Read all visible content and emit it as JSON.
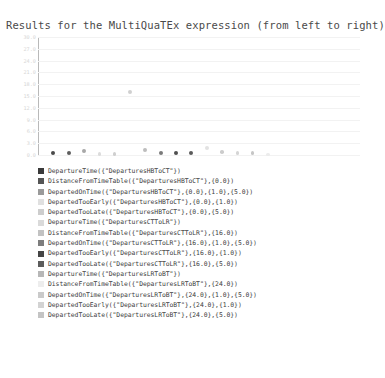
{
  "title": "Results for the MultiQuaTEx expression (from left to right)",
  "colors": {
    "axis": "#b9b9b9",
    "grid": "#f2f2f2",
    "text": "#3d3d3d",
    "tick_text": "#d6d6d6",
    "background": "#ffffff"
  },
  "chart_data": {
    "type": "scatter",
    "title": "Results for the MultiQuaTEx expression (from left to right)",
    "xlabel": "",
    "ylabel": "",
    "grid": true,
    "legend_position": "bottom",
    "ylim": [
      0.0,
      30.0
    ],
    "xlim": [
      0,
      21
    ],
    "yticks": [
      "30.0",
      "27.0",
      "24.0",
      "21.0",
      "18.0",
      "15.0",
      "12.0",
      "9.0",
      "6.0",
      "3.0",
      "0.0"
    ],
    "ytick_values": [
      30.0,
      27.0,
      24.0,
      21.0,
      18.0,
      15.0,
      12.0,
      9.0,
      6.0,
      3.0,
      0.0
    ],
    "xticks": [],
    "points": [
      {
        "index": 1,
        "x": 1,
        "y": 0.55,
        "color": "#4a4a4a",
        "size": 4.2
      },
      {
        "index": 2,
        "x": 2,
        "y": 0.5,
        "color": "#5e5e5e",
        "size": 4.0
      },
      {
        "index": 3,
        "x": 3,
        "y": 0.95,
        "color": "#a8a8a8",
        "size": 3.9
      },
      {
        "index": 4,
        "x": 4,
        "y": 0.25,
        "color": "#dcdcdc",
        "size": 3.4
      },
      {
        "index": 5,
        "x": 5,
        "y": 0.25,
        "color": "#cfcfcf",
        "size": 3.4
      },
      {
        "index": 6,
        "x": 6,
        "y": 16.0,
        "color": "#d0d0d0",
        "size": 4.2
      },
      {
        "index": 7,
        "x": 7,
        "y": 1.3,
        "color": "#bdbdbd",
        "size": 3.8
      },
      {
        "index": 8,
        "x": 8,
        "y": 0.6,
        "color": "#7a7a7a",
        "size": 4.0
      },
      {
        "index": 9,
        "x": 9,
        "y": 0.5,
        "color": "#4f4f4f",
        "size": 4.2
      },
      {
        "index": 10,
        "x": 10,
        "y": 0.45,
        "color": "#5a5a5a",
        "size": 4.2
      },
      {
        "index": 11,
        "x": 11,
        "y": 1.75,
        "color": "#e2e2e2",
        "size": 4.0
      },
      {
        "index": 12,
        "x": 12,
        "y": 0.8,
        "color": "#cccccc",
        "size": 3.6
      },
      {
        "index": 13,
        "x": 13,
        "y": 0.45,
        "color": "#d5d5d5",
        "size": 3.5
      },
      {
        "index": 14,
        "x": 14,
        "y": 0.45,
        "color": "#c6c6c6",
        "size": 3.6
      },
      {
        "index": 15,
        "x": 15,
        "y": 0.2,
        "color": "#ececec",
        "size": 3.2
      }
    ],
    "outlier": {
      "x": 6,
      "y": 16.0,
      "note": "single point raised well above the baseline cluster"
    }
  },
  "legend": {
    "entries": [
      {
        "swatch": "#3a3a3a",
        "label": "DepartureTime({\"DeparturesHBToCT\"})"
      },
      {
        "swatch": "#555555",
        "label": "DistanceFromTimeTable({\"DeparturesHBToCT\"},{0.0})"
      },
      {
        "swatch": "#9a9a9a",
        "label": "DepartedOnTime({\"DeparturesHBToCT\"},{0.0},{1.0},{5.0})"
      },
      {
        "swatch": "#e0e0e0",
        "label": "DepartedTooEarly({\"DeparturesHBToCT\"},{0.0},{1.0})"
      },
      {
        "swatch": "#cdcdcd",
        "label": "DepartedTooLate({\"DeparturesHBToCT\"},{0.0},{5.0})"
      },
      {
        "swatch": "#dadada",
        "label": "DepartureTime({\"DeparturesCTToLR\"})"
      },
      {
        "swatch": "#c2c2c2",
        "label": "DistanceFromTimeTable({\"DeparturesCTToLR\"},{16.0})"
      },
      {
        "swatch": "#7d7d7d",
        "label": "DepartedOnTime({\"DeparturesCTToLR\"},{16.0},{1.0},{5.0})"
      },
      {
        "swatch": "#454545",
        "label": "DepartedTooEarly({\"DeparturesCTToLR\"},{16.0},{1.0})"
      },
      {
        "swatch": "#5c5c5c",
        "label": "DepartedTooLate({\"DeparturesCTToLR\"},{16.0},{5.0})"
      },
      {
        "swatch": "#b7b7b7",
        "label": "DepartureTime({\"DeparturesLRToBT\"})"
      },
      {
        "swatch": "#ededed",
        "label": "DistanceFromTimeTable({\"DeparturesLRToBT\"},{24.0})"
      },
      {
        "swatch": "#cacaca",
        "label": "DepartedOnTime({\"DeparturesLRToBT\"},{24.0},{1.0},{5.0})"
      },
      {
        "swatch": "#d3d3d3",
        "label": "DepartedTooEarly({\"DeparturesLRToBT\"},{24.0},{1.0})"
      },
      {
        "swatch": "#c4c4c4",
        "label": "DepartedTooLate({\"DeparturesLRToBT\"},{24.0},{5.0})"
      }
    ]
  }
}
